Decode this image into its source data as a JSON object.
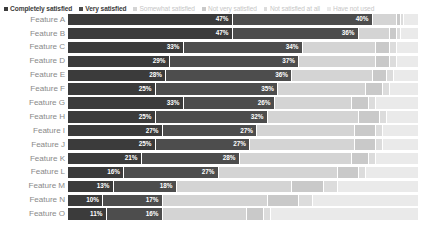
{
  "legend": {
    "items": [
      {
        "label": "Completely satisfied",
        "color": "#3b3b3b",
        "emphasis": "strong"
      },
      {
        "label": "Very satisfied",
        "color": "#4d4d4d",
        "emphasis": "strong"
      },
      {
        "label": "Somewhat satisfied",
        "color": "#d4d4d4",
        "emphasis": "dim"
      },
      {
        "label": "Not very satisfied",
        "color": "#c9c9c9",
        "emphasis": "dim"
      },
      {
        "label": "Not satisfied at all",
        "color": "#dcdcdc",
        "emphasis": "dim"
      },
      {
        "label": "Have not used",
        "color": "#eaeaea",
        "emphasis": "dim"
      }
    ]
  },
  "chart_data": {
    "type": "bar",
    "subtype": "stacked-horizontal-100-percent",
    "title": "",
    "xlabel": "",
    "ylabel": "",
    "xlim": [
      0,
      100
    ],
    "grid": false,
    "legend_position": "top-left",
    "value_label_suffix": "%",
    "value_labels_shown_for_series": [
      "Completely satisfied",
      "Very satisfied"
    ],
    "categories": [
      "Feature A",
      "Feature B",
      "Feature C",
      "Feature D",
      "Feature E",
      "Feature F",
      "Feature G",
      "Feature H",
      "Feature I",
      "Feature J",
      "Feature K",
      "Feature L",
      "Feature M",
      "Feature N",
      "Feature O"
    ],
    "series": [
      {
        "name": "Completely satisfied",
        "color": "#3b3b3b",
        "values": [
          47,
          47,
          33,
          29,
          28,
          25,
          33,
          25,
          27,
          25,
          21,
          16,
          13,
          10,
          11
        ]
      },
      {
        "name": "Very satisfied",
        "color": "#4d4d4d",
        "values": [
          40,
          36,
          34,
          37,
          36,
          35,
          26,
          32,
          27,
          27,
          28,
          27,
          18,
          17,
          16
        ]
      },
      {
        "name": "Somewhat satisfied",
        "color": "#d4d4d4",
        "values": [
          7,
          9,
          21,
          22,
          23,
          25,
          22,
          26,
          28,
          30,
          32,
          34,
          33,
          30,
          24
        ]
      },
      {
        "name": "Not very satisfied",
        "color": "#c9c9c9",
        "values": [
          1,
          2,
          4,
          4,
          4,
          5,
          5,
          6,
          6,
          6,
          5,
          6,
          9,
          9,
          5
        ]
      },
      {
        "name": "Not satisfied at all",
        "color": "#dcdcdc",
        "values": [
          1,
          1,
          2,
          2,
          2,
          2,
          2,
          2,
          2,
          2,
          2,
          2,
          4,
          4,
          2
        ]
      },
      {
        "name": "Have not used",
        "color": "#eaeaea",
        "values": [
          4,
          5,
          6,
          6,
          7,
          8,
          12,
          9,
          10,
          10,
          12,
          15,
          23,
          30,
          42
        ]
      }
    ],
    "rows": [
      {
        "category": "Feature A",
        "segments": [
          {
            "series": "Completely satisfied",
            "value": 47,
            "label": "47%"
          },
          {
            "series": "Very satisfied",
            "value": 40,
            "label": "40%"
          },
          {
            "series": "Somewhat satisfied",
            "value": 7,
            "label": ""
          },
          {
            "series": "Not very satisfied",
            "value": 1,
            "label": ""
          },
          {
            "series": "Not satisfied at all",
            "value": 1,
            "label": ""
          },
          {
            "series": "Have not used",
            "value": 4,
            "label": ""
          }
        ]
      },
      {
        "category": "Feature B",
        "segments": [
          {
            "series": "Completely satisfied",
            "value": 47,
            "label": "47%"
          },
          {
            "series": "Very satisfied",
            "value": 36,
            "label": "36%"
          },
          {
            "series": "Somewhat satisfied",
            "value": 9,
            "label": ""
          },
          {
            "series": "Not very satisfied",
            "value": 2,
            "label": ""
          },
          {
            "series": "Not satisfied at all",
            "value": 1,
            "label": ""
          },
          {
            "series": "Have not used",
            "value": 5,
            "label": ""
          }
        ]
      },
      {
        "category": "Feature C",
        "segments": [
          {
            "series": "Completely satisfied",
            "value": 33,
            "label": "33%"
          },
          {
            "series": "Very satisfied",
            "value": 34,
            "label": "34%"
          },
          {
            "series": "Somewhat satisfied",
            "value": 21,
            "label": ""
          },
          {
            "series": "Not very satisfied",
            "value": 4,
            "label": ""
          },
          {
            "series": "Not satisfied at all",
            "value": 2,
            "label": ""
          },
          {
            "series": "Have not used",
            "value": 6,
            "label": ""
          }
        ]
      },
      {
        "category": "Feature D",
        "segments": [
          {
            "series": "Completely satisfied",
            "value": 29,
            "label": "29%"
          },
          {
            "series": "Very satisfied",
            "value": 37,
            "label": "37%"
          },
          {
            "series": "Somewhat satisfied",
            "value": 22,
            "label": ""
          },
          {
            "series": "Not very satisfied",
            "value": 4,
            "label": ""
          },
          {
            "series": "Not satisfied at all",
            "value": 2,
            "label": ""
          },
          {
            "series": "Have not used",
            "value": 6,
            "label": ""
          }
        ]
      },
      {
        "category": "Feature E",
        "segments": [
          {
            "series": "Completely satisfied",
            "value": 28,
            "label": "28%"
          },
          {
            "series": "Very satisfied",
            "value": 36,
            "label": "36%"
          },
          {
            "series": "Somewhat satisfied",
            "value": 23,
            "label": ""
          },
          {
            "series": "Not very satisfied",
            "value": 4,
            "label": ""
          },
          {
            "series": "Not satisfied at all",
            "value": 2,
            "label": ""
          },
          {
            "series": "Have not used",
            "value": 7,
            "label": ""
          }
        ]
      },
      {
        "category": "Feature F",
        "segments": [
          {
            "series": "Completely satisfied",
            "value": 25,
            "label": "25%"
          },
          {
            "series": "Very satisfied",
            "value": 35,
            "label": "35%"
          },
          {
            "series": "Somewhat satisfied",
            "value": 25,
            "label": ""
          },
          {
            "series": "Not very satisfied",
            "value": 5,
            "label": ""
          },
          {
            "series": "Not satisfied at all",
            "value": 2,
            "label": ""
          },
          {
            "series": "Have not used",
            "value": 8,
            "label": ""
          }
        ]
      },
      {
        "category": "Feature G",
        "segments": [
          {
            "series": "Completely satisfied",
            "value": 33,
            "label": "33%"
          },
          {
            "series": "Very satisfied",
            "value": 26,
            "label": "26%"
          },
          {
            "series": "Somewhat satisfied",
            "value": 22,
            "label": ""
          },
          {
            "series": "Not very satisfied",
            "value": 5,
            "label": ""
          },
          {
            "series": "Not satisfied at all",
            "value": 2,
            "label": ""
          },
          {
            "series": "Have not used",
            "value": 12,
            "label": ""
          }
        ]
      },
      {
        "category": "Feature H",
        "segments": [
          {
            "series": "Completely satisfied",
            "value": 25,
            "label": "25%"
          },
          {
            "series": "Very satisfied",
            "value": 32,
            "label": "32%"
          },
          {
            "series": "Somewhat satisfied",
            "value": 26,
            "label": ""
          },
          {
            "series": "Not very satisfied",
            "value": 6,
            "label": ""
          },
          {
            "series": "Not satisfied at all",
            "value": 2,
            "label": ""
          },
          {
            "series": "Have not used",
            "value": 9,
            "label": ""
          }
        ]
      },
      {
        "category": "Feature I",
        "segments": [
          {
            "series": "Completely satisfied",
            "value": 27,
            "label": "27%"
          },
          {
            "series": "Very satisfied",
            "value": 27,
            "label": "27%"
          },
          {
            "series": "Somewhat satisfied",
            "value": 28,
            "label": ""
          },
          {
            "series": "Not very satisfied",
            "value": 6,
            "label": ""
          },
          {
            "series": "Not satisfied at all",
            "value": 2,
            "label": ""
          },
          {
            "series": "Have not used",
            "value": 10,
            "label": ""
          }
        ]
      },
      {
        "category": "Feature J",
        "segments": [
          {
            "series": "Completely satisfied",
            "value": 25,
            "label": "25%"
          },
          {
            "series": "Very satisfied",
            "value": 27,
            "label": "27%"
          },
          {
            "series": "Somewhat satisfied",
            "value": 30,
            "label": ""
          },
          {
            "series": "Not very satisfied",
            "value": 6,
            "label": ""
          },
          {
            "series": "Not satisfied at all",
            "value": 2,
            "label": ""
          },
          {
            "series": "Have not used",
            "value": 10,
            "label": ""
          }
        ]
      },
      {
        "category": "Feature K",
        "segments": [
          {
            "series": "Completely satisfied",
            "value": 21,
            "label": "21%"
          },
          {
            "series": "Very satisfied",
            "value": 28,
            "label": "28%"
          },
          {
            "series": "Somewhat satisfied",
            "value": 32,
            "label": ""
          },
          {
            "series": "Not very satisfied",
            "value": 5,
            "label": ""
          },
          {
            "series": "Not satisfied at all",
            "value": 2,
            "label": ""
          },
          {
            "series": "Have not used",
            "value": 12,
            "label": ""
          }
        ]
      },
      {
        "category": "Feature L",
        "segments": [
          {
            "series": "Completely satisfied",
            "value": 16,
            "label": "16%"
          },
          {
            "series": "Very satisfied",
            "value": 27,
            "label": "27%"
          },
          {
            "series": "Somewhat satisfied",
            "value": 34,
            "label": ""
          },
          {
            "series": "Not very satisfied",
            "value": 6,
            "label": ""
          },
          {
            "series": "Not satisfied at all",
            "value": 2,
            "label": ""
          },
          {
            "series": "Have not used",
            "value": 15,
            "label": ""
          }
        ]
      },
      {
        "category": "Feature M",
        "segments": [
          {
            "series": "Completely satisfied",
            "value": 13,
            "label": "13%"
          },
          {
            "series": "Very satisfied",
            "value": 18,
            "label": "18%"
          },
          {
            "series": "Somewhat satisfied",
            "value": 33,
            "label": ""
          },
          {
            "series": "Not very satisfied",
            "value": 9,
            "label": ""
          },
          {
            "series": "Not satisfied at all",
            "value": 4,
            "label": ""
          },
          {
            "series": "Have not used",
            "value": 23,
            "label": ""
          }
        ]
      },
      {
        "category": "Feature N",
        "segments": [
          {
            "series": "Completely satisfied",
            "value": 10,
            "label": "10%"
          },
          {
            "series": "Very satisfied",
            "value": 17,
            "label": "17%"
          },
          {
            "series": "Somewhat satisfied",
            "value": 30,
            "label": ""
          },
          {
            "series": "Not very satisfied",
            "value": 9,
            "label": ""
          },
          {
            "series": "Not satisfied at all",
            "value": 4,
            "label": ""
          },
          {
            "series": "Have not used",
            "value": 30,
            "label": ""
          }
        ]
      },
      {
        "category": "Feature O",
        "segments": [
          {
            "series": "Completely satisfied",
            "value": 11,
            "label": "11%"
          },
          {
            "series": "Very satisfied",
            "value": 16,
            "label": "16%"
          },
          {
            "series": "Somewhat satisfied",
            "value": 24,
            "label": ""
          },
          {
            "series": "Not very satisfied",
            "value": 5,
            "label": ""
          },
          {
            "series": "Not satisfied at all",
            "value": 2,
            "label": ""
          },
          {
            "series": "Have not used",
            "value": 42,
            "label": ""
          }
        ]
      }
    ]
  }
}
